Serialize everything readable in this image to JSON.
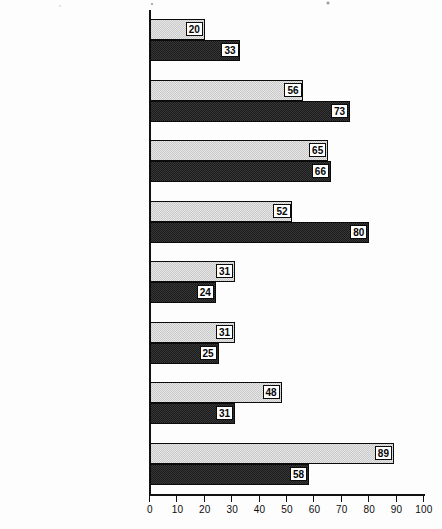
{
  "chart_data": {
    "type": "bar",
    "orientation": "horizontal",
    "title": "",
    "xlabel": "",
    "ylabel": "",
    "xlim": [
      0,
      100
    ],
    "xticks": [
      0,
      10,
      20,
      30,
      40,
      50,
      60,
      70,
      80,
      90,
      100
    ],
    "grid": false,
    "legend": "none",
    "categories": [
      "Party values",
      "Electoral values",
      "Populist values",
      "Liberal values",
      "Cultural nationalism",
      "Centralist nationalism",
      "External nationalism",
      "Socialist values"
    ],
    "series": [
      {
        "name": "series-1",
        "color": "#c9c9c9",
        "values": [
          20,
          56,
          65,
          52,
          31,
          31,
          48,
          89
        ]
      },
      {
        "name": "series-2",
        "color": "#1b1b1b",
        "values": [
          33,
          73,
          66,
          80,
          24,
          25,
          31,
          58
        ]
      }
    ]
  },
  "axis": {
    "tick_labels": [
      "0",
      "10",
      "20",
      "30",
      "40",
      "50",
      "60",
      "70",
      "80",
      "90",
      "100"
    ]
  },
  "colors": {
    "series1": "#c9c9c9",
    "series2": "#1b1b1b",
    "axis": "#111111",
    "label_box_background": "#ffffff",
    "background": "#fdfdfd"
  }
}
